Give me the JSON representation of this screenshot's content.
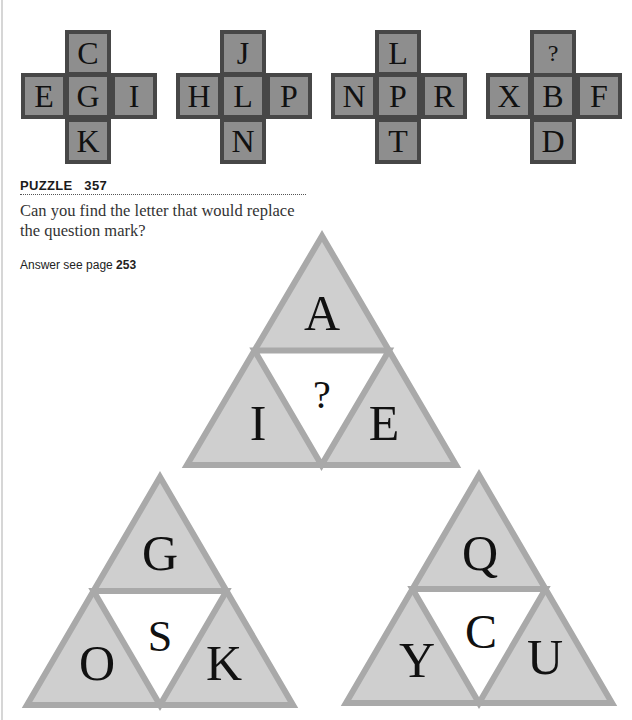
{
  "crosses": [
    {
      "top": "C",
      "left": "E",
      "center": "G",
      "right": "I",
      "bottom": "K"
    },
    {
      "top": "J",
      "left": "H",
      "center": "L",
      "right": "P",
      "bottom": "N"
    },
    {
      "top": "L",
      "left": "N",
      "center": "P",
      "right": "R",
      "bottom": "T"
    },
    {
      "top": "?",
      "left": "X",
      "center": "B",
      "right": "F",
      "bottom": "D"
    }
  ],
  "puzzle": {
    "label": "PUZZLE",
    "number": "357",
    "question": "Can you find the letter that would replace the question mark?",
    "answer_prefix": "Answer see page",
    "answer_page": "253"
  },
  "triangles": [
    {
      "top": "A",
      "left": "I",
      "right": "E",
      "center": "?"
    },
    {
      "top": "G",
      "left": "O",
      "right": "K",
      "center": "S"
    },
    {
      "top": "Q",
      "left": "Y",
      "right": "U",
      "center": "C"
    }
  ],
  "colors": {
    "cell_fill": "#8e8e8e",
    "cell_border": "#474747",
    "triangle_fill": "#cfcfcf",
    "triangle_border": "#a9a9a9",
    "center_fill": "#ffffff"
  }
}
